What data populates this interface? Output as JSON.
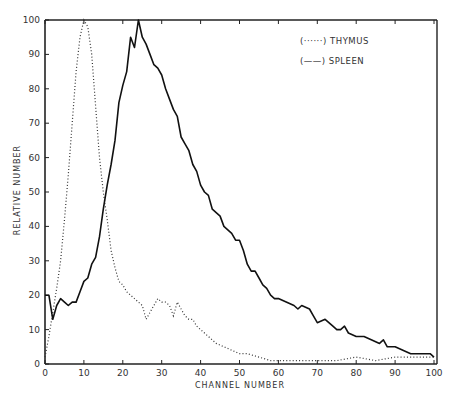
{
  "chart_data": {
    "type": "line",
    "title": "",
    "xlabel": "CHANNEL NUMBER",
    "ylabel": "RELATIVE NUMBER",
    "xlim": [
      0,
      100
    ],
    "ylim": [
      0,
      100
    ],
    "xticks": [
      0,
      10,
      20,
      30,
      40,
      50,
      60,
      70,
      80,
      90,
      100
    ],
    "yticks": [
      0,
      10,
      20,
      30,
      40,
      50,
      60,
      70,
      80,
      90,
      100
    ],
    "grid": false,
    "legend_position": "upper right",
    "series": [
      {
        "name": "THYMUS",
        "legend_label": "(······) THYMUS",
        "style": "dotted",
        "x": [
          0,
          1,
          2,
          3,
          4,
          5,
          6,
          7,
          8,
          9,
          10,
          11,
          12,
          13,
          14,
          15,
          16,
          17,
          18,
          19,
          20,
          21,
          22,
          23,
          24,
          25,
          26,
          27,
          28,
          29,
          30,
          31,
          32,
          33,
          34,
          35,
          36,
          37,
          38,
          39,
          40,
          42,
          44,
          46,
          48,
          50,
          52,
          55,
          58,
          60,
          65,
          70,
          75,
          80,
          85,
          90,
          95,
          100
        ],
        "y": [
          2,
          8,
          15,
          22,
          30,
          42,
          55,
          70,
          85,
          95,
          100,
          98,
          90,
          75,
          60,
          50,
          42,
          33,
          28,
          24,
          23,
          21,
          20,
          19,
          18,
          17,
          13,
          15,
          17,
          19,
          18,
          18,
          17,
          14,
          18,
          16,
          14,
          13,
          13,
          11,
          10,
          8,
          6,
          5,
          4,
          3,
          3,
          2,
          1,
          1,
          1,
          1,
          1,
          2,
          1,
          2,
          2,
          2
        ]
      },
      {
        "name": "SPLEEN",
        "legend_label": "(——) SPLEEN",
        "style": "solid",
        "x": [
          0,
          1,
          2,
          3,
          4,
          5,
          6,
          7,
          8,
          9,
          10,
          11,
          12,
          13,
          14,
          15,
          16,
          17,
          18,
          19,
          20,
          21,
          22,
          23,
          24,
          25,
          26,
          27,
          28,
          29,
          30,
          31,
          32,
          33,
          34,
          35,
          36,
          37,
          38,
          39,
          40,
          41,
          42,
          43,
          44,
          45,
          46,
          47,
          48,
          49,
          50,
          51,
          52,
          53,
          54,
          55,
          56,
          57,
          58,
          59,
          60,
          62,
          64,
          65,
          66,
          68,
          69,
          70,
          72,
          74,
          75,
          76,
          77,
          78,
          80,
          81,
          82,
          84,
          86,
          87,
          88,
          90,
          92,
          94,
          95,
          97,
          99,
          100
        ],
        "y": [
          20,
          20,
          13,
          17,
          19,
          18,
          17,
          18,
          18,
          21,
          24,
          25,
          29,
          31,
          37,
          45,
          52,
          58,
          65,
          76,
          81,
          85,
          95,
          92,
          100,
          95,
          93,
          90,
          87,
          86,
          84,
          80,
          77,
          74,
          72,
          66,
          64,
          62,
          58,
          56,
          52,
          50,
          49,
          45,
          44,
          43,
          40,
          39,
          38,
          36,
          36,
          33,
          29,
          27,
          27,
          25,
          23,
          22,
          20,
          19,
          19,
          18,
          17,
          16,
          17,
          16,
          14,
          12,
          13,
          11,
          10,
          10,
          11,
          9,
          8,
          8,
          8,
          7,
          6,
          7,
          5,
          5,
          4,
          3,
          3,
          3,
          3,
          2
        ]
      }
    ]
  },
  "legend": {
    "thymus": "(······) THYMUS",
    "spleen": "(——) SPLEEN"
  },
  "axes": {
    "xlabel": "CHANNEL NUMBER",
    "ylabel": "RELATIVE NUMBER"
  }
}
